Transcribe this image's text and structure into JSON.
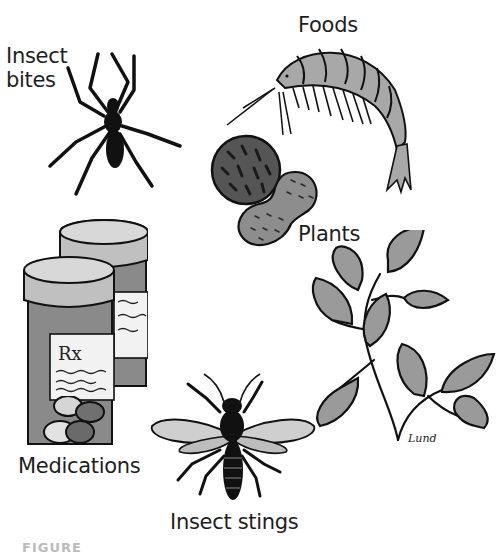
{
  "figure": {
    "labels": {
      "insect_bites": [
        "Insect",
        "bites"
      ],
      "foods": "Foods",
      "plants": "Plants",
      "medications": "Medications",
      "insect_stings": "Insect stings"
    },
    "rx_label": "Rx",
    "signature": "Lund",
    "caption": "FIGURE"
  },
  "colors": {
    "ink": "#1a1a1a",
    "dark_gray": "#4a4a4a",
    "mid_gray": "#8a8a8a",
    "light_gray": "#b5b5b5",
    "pale_gray": "#dcdcdc",
    "background": "#ffffff"
  }
}
